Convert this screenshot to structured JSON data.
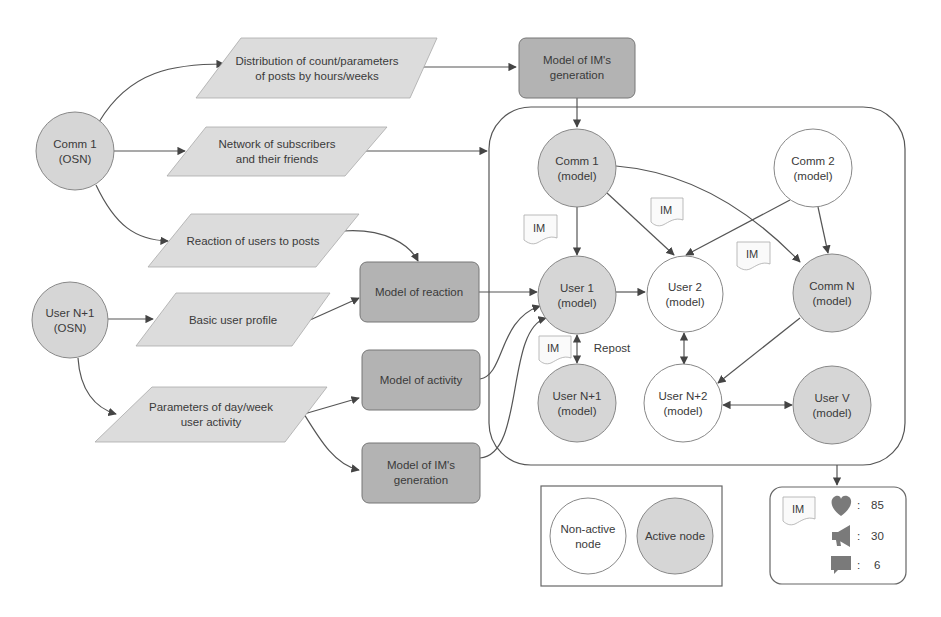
{
  "colors": {
    "active_fill": "#d6d6d6",
    "model_box_fill": "#b3b3b3",
    "data_fill": "#dcdcdc",
    "inactive_fill": "#ffffff",
    "stroke": "#555555",
    "icon_fill": "#7a7a7a"
  },
  "sources": {
    "comm1_osn": {
      "line1": "Comm 1",
      "line2": "(OSN)"
    },
    "usern1_osn": {
      "line1": "User N+1",
      "line2": "(OSN)"
    }
  },
  "data_blocks": {
    "distribution": {
      "line1": "Distribution of count/parameters",
      "line2": "of posts by hours/weeks"
    },
    "network": {
      "line1": "Network of subscribers",
      "line2": "and their friends"
    },
    "reaction_users": {
      "line1": "Reaction of users to posts"
    },
    "basic_profile": {
      "line1": "Basic user profile"
    },
    "parameters_activity": {
      "line1": "Parameters of day/week",
      "line2": "user activity"
    }
  },
  "models": {
    "im_generation_top": {
      "line1": "Model of IM's",
      "line2": "generation"
    },
    "reaction": {
      "line1": "Model of reaction"
    },
    "activity": {
      "line1": "Model of activity"
    },
    "im_generation_bottom": {
      "line1": "Model of IM's",
      "line2": "generation"
    }
  },
  "network_nodes": {
    "comm1": {
      "line1": "Comm 1",
      "line2": "(model)",
      "active": true
    },
    "comm2": {
      "line1": "Comm 2",
      "line2": "(model)",
      "active": false
    },
    "user1": {
      "line1": "User 1",
      "line2": "(model)",
      "active": true
    },
    "user2": {
      "line1": "User 2",
      "line2": "(model)",
      "active": false
    },
    "commN": {
      "line1": "Comm N",
      "line2": "(model)",
      "active": true
    },
    "usern1": {
      "line1": "User N+1",
      "line2": "(model)",
      "active": true
    },
    "usern2": {
      "line1": "User N+2",
      "line2": "(model)",
      "active": false
    },
    "userV": {
      "line1": "User V",
      "line2": "(model)",
      "active": true
    }
  },
  "im_label": "IM",
  "repost_label": "Repost",
  "legend": {
    "non_active": {
      "line1": "Non-active",
      "line2": "node"
    },
    "active": {
      "line1": "Active node"
    }
  },
  "stats": {
    "separator": ":",
    "likes": "85",
    "reposts": "30",
    "comments": "6"
  }
}
